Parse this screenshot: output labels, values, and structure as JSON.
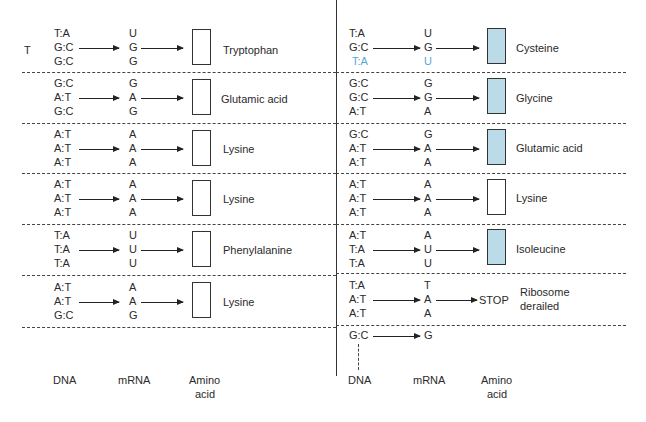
{
  "left_panel": {
    "side_label": "T",
    "rows": [
      {
        "dna": [
          "T:A",
          "G:C",
          "G:C"
        ],
        "mrna": [
          "U",
          "G",
          "G"
        ],
        "amino_acid": "Tryptophan",
        "shaded": false
      },
      {
        "dna": [
          "G:C",
          "A:T",
          "G:C"
        ],
        "mrna": [
          "G",
          "A",
          "G"
        ],
        "amino_acid": "Glutamic acid",
        "shaded": false
      },
      {
        "dna": [
          "A:T",
          "A:T",
          "A:T"
        ],
        "mrna": [
          "A",
          "A",
          "A"
        ],
        "amino_acid": "Lysine",
        "shaded": false
      },
      {
        "dna": [
          "A:T",
          "A:T",
          "A:T"
        ],
        "mrna": [
          "A",
          "A",
          "A"
        ],
        "amino_acid": "Lysine",
        "shaded": false
      },
      {
        "dna": [
          "T:A",
          "T:A",
          "T:A"
        ],
        "mrna": [
          "U",
          "U",
          "U"
        ],
        "amino_acid": "Phenylalanine",
        "shaded": false
      },
      {
        "dna": [
          "A:T",
          "A:T",
          "G:C"
        ],
        "mrna": [
          "A",
          "A",
          "G"
        ],
        "amino_acid": "Lysine",
        "shaded": false
      }
    ],
    "column_labels": {
      "dna": "DNA",
      "mrna": "mRNA",
      "amino_line1": "Amino",
      "amino_line2": "acid"
    }
  },
  "right_panel": {
    "rows": [
      {
        "dna": [
          "T:A",
          "G:C",
          "T:A"
        ],
        "mrna": [
          "U",
          "G",
          "U"
        ],
        "highlight_third": true,
        "amino_acid": "Cysteine",
        "shaded": true
      },
      {
        "dna": [
          "G:C",
          "G:C",
          "A:T"
        ],
        "mrna": [
          "G",
          "G",
          "A"
        ],
        "amino_acid": "Glycine",
        "shaded": true
      },
      {
        "dna": [
          "G:C",
          "A:T",
          "A:T"
        ],
        "mrna": [
          "G",
          "A",
          "A"
        ],
        "amino_acid": "Glutamic acid",
        "shaded": true
      },
      {
        "dna": [
          "A:T",
          "A:T",
          "A:T"
        ],
        "mrna": [
          "A",
          "A",
          "A"
        ],
        "amino_acid": "Lysine",
        "shaded": false
      },
      {
        "dna": [
          "A:T",
          "T:A",
          "T:A"
        ],
        "mrna": [
          "A",
          "U",
          "U"
        ],
        "amino_acid": "Isoleucine",
        "shaded": true
      },
      {
        "dna": [
          "T:A",
          "A:T",
          "A:T"
        ],
        "mrna": [
          "T",
          "A",
          "A"
        ],
        "stop_label": "STOP",
        "note_line1": "Ribosome",
        "note_line2": "derailed"
      }
    ],
    "trailing": {
      "dna": "G:C",
      "mrna": "G"
    },
    "column_labels": {
      "dna": "DNA",
      "mrna": "mRNA",
      "amino_line1": "Amino",
      "amino_line2": "acid"
    }
  },
  "colors": {
    "shaded_box": "#bcdbe9",
    "highlight_text": "#5aa5d6",
    "line": "#333333"
  }
}
